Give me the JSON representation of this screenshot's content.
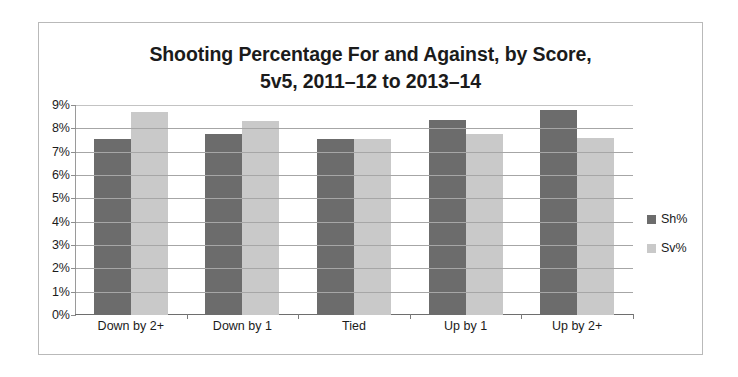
{
  "chart_data": {
    "type": "bar",
    "title": "Shooting Percentage For and Against, by Score, 5v5, 2011–12 to 2013–14",
    "title_line1": "Shooting Percentage For and Against, by Score,",
    "title_line2": "5v5, 2011–12 to 2013–14",
    "categories": [
      "Down by 2+",
      "Down by 1",
      "Tied",
      "Up by 1",
      "Up by 2+"
    ],
    "series": [
      {
        "name": "Sh%",
        "color": "#6c6c6c",
        "values": [
          7.55,
          7.75,
          7.55,
          8.35,
          8.8
        ]
      },
      {
        "name": "Sv%",
        "color": "#c9c9c9",
        "values": [
          8.7,
          8.3,
          7.55,
          7.75,
          7.6
        ]
      }
    ],
    "xlabel": "",
    "ylabel": "",
    "ylim": [
      0,
      9
    ],
    "ytick_values": [
      9,
      8,
      7,
      6,
      5,
      4,
      3,
      2,
      1,
      0
    ],
    "ytick_labels": [
      "9%",
      "8%",
      "7%",
      "6%",
      "5%",
      "4%",
      "3%",
      "2%",
      "1%",
      "0%"
    ],
    "grid": true,
    "legend_position": "right",
    "value_suffix": "%"
  }
}
